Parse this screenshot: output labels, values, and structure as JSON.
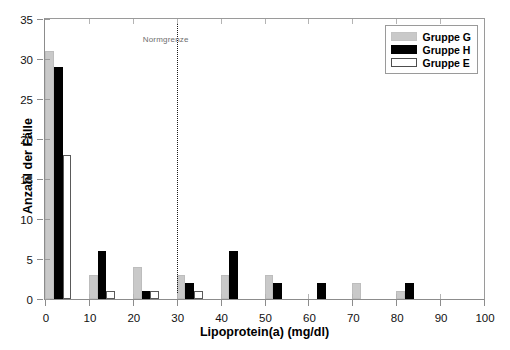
{
  "chart_data": {
    "type": "bar",
    "title": "",
    "xlabel": "Lipoprotein(a) (mg/dl)",
    "ylabel": "Anzahl der Fälle",
    "xlim": [
      0,
      100
    ],
    "ylim": [
      0,
      35
    ],
    "xticks": [
      0,
      10,
      20,
      30,
      40,
      50,
      60,
      70,
      80,
      90,
      100
    ],
    "yticks": [
      0,
      5,
      10,
      15,
      20,
      25,
      30,
      35
    ],
    "grid": false,
    "legend_position": "top-right",
    "bin_width": 10,
    "bin_starts": [
      0,
      10,
      20,
      30,
      40,
      50,
      60,
      70,
      80,
      90
    ],
    "categories": [
      "0-10",
      "10-20",
      "20-30",
      "30-40",
      "40-50",
      "50-60",
      "60-70",
      "70-80",
      "80-90",
      "90-100"
    ],
    "series": [
      {
        "name": "Gruppe G",
        "color": "#c9c9c9",
        "values": [
          31,
          3,
          4,
          3,
          3,
          3,
          0,
          2,
          1,
          0
        ]
      },
      {
        "name": "Gruppe H",
        "color": "#000000",
        "values": [
          29,
          6,
          1,
          2,
          6,
          2,
          2,
          0,
          2,
          0
        ]
      },
      {
        "name": "Gruppe E",
        "color": "#ffffff",
        "values": [
          18,
          1,
          1,
          1,
          0,
          0,
          0,
          0,
          0,
          0
        ]
      }
    ],
    "annotations": [
      {
        "name": "normgrenze",
        "label": "Normgrenze",
        "x": 30,
        "style": "vertical-dotted-line",
        "color": "#1a1a1a"
      }
    ]
  },
  "legend": {
    "items": [
      {
        "label": "Gruppe G",
        "swatch": "g"
      },
      {
        "label": "Gruppe H",
        "swatch": "h"
      },
      {
        "label": "Gruppe E",
        "swatch": "e"
      }
    ]
  }
}
